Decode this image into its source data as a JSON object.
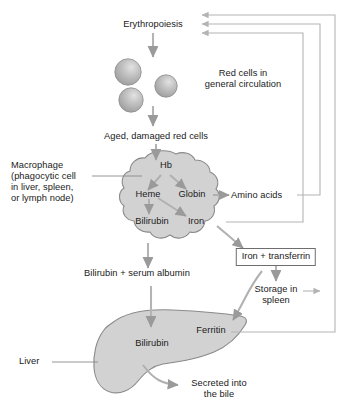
{
  "diagram": {
    "colors": {
      "text": "#1a1a1a",
      "arrow": "#9a9a9a",
      "line": "#b4b4b4",
      "organ_fill": "#d2d2d2",
      "organ_stroke": "#8a8a8a",
      "cell_fill": "#b6b6b6",
      "cell_highlight": "#dcdcdc",
      "box_border": "#6e6e6e",
      "background": "#ffffff"
    },
    "nodes": {
      "erythropoiesis": "Erythropoiesis",
      "red_cells": "Red cells in\ngeneral circulation",
      "aged_cells": "Aged, damaged red cells",
      "macrophage": "Macrophage\n(phagocytic cell\nin liver, spleen,\nor lymph node)",
      "hb": "Hb",
      "heme": "Heme",
      "globin": "Globin",
      "iron": "Iron",
      "bilirubin_macrophage": "Bilirubin",
      "amino_acids": "Amino acids",
      "iron_transferrin": "Iron + transferrin",
      "storage_spleen": "Storage in\nspleen",
      "bilirubin_albumin": "Bilirubin + serum albumin",
      "liver": "Liver",
      "bilirubin_liver": "Bilirubin",
      "ferritin": "Ferritin",
      "secreted_bile": "Secreted into\nthe bile"
    },
    "shapes": {
      "red_cell_count": 3,
      "macrophage_shape": "irregular-blob",
      "liver_shape": "liver-silhouette"
    },
    "edges": [
      {
        "from": "erythropoiesis",
        "to": "red_cells",
        "style": "arrow-down"
      },
      {
        "from": "red_cells",
        "to": "aged_cells",
        "style": "arrow-down"
      },
      {
        "from": "aged_cells",
        "to": "hb",
        "style": "arrow-down"
      },
      {
        "from": "hb",
        "to": "heme",
        "style": "arrow-diagonal"
      },
      {
        "from": "hb",
        "to": "globin",
        "style": "arrow-diagonal"
      },
      {
        "from": "globin",
        "to": "amino_acids",
        "style": "arrow-right"
      },
      {
        "from": "heme",
        "to": "iron",
        "style": "arrow-diagonal"
      },
      {
        "from": "heme",
        "to": "bilirubin_macrophage",
        "style": "arrow-down"
      },
      {
        "from": "bilirubin_macrophage",
        "to": "bilirubin_albumin",
        "style": "arrow-down"
      },
      {
        "from": "iron",
        "to": "iron_transferrin",
        "style": "arrow-diagonal"
      },
      {
        "from": "iron_transferrin",
        "to": "storage_spleen",
        "style": "arrow-down"
      },
      {
        "from": "iron_transferrin",
        "to": "ferritin",
        "style": "arrow-curve"
      },
      {
        "from": "bilirubin_albumin",
        "to": "bilirubin_liver",
        "style": "arrow-down"
      },
      {
        "from": "bilirubin_liver",
        "to": "secreted_bile",
        "style": "arrow-curve"
      },
      {
        "from": "amino_acids",
        "to": "erythropoiesis",
        "style": "feedback-loop"
      },
      {
        "from": "iron",
        "to": "erythropoiesis",
        "style": "feedback-loop"
      },
      {
        "from": "storage_spleen",
        "to": "erythropoiesis",
        "style": "feedback-loop"
      },
      {
        "from": "ferritin",
        "to": "erythropoiesis",
        "style": "feedback-loop"
      }
    ]
  }
}
